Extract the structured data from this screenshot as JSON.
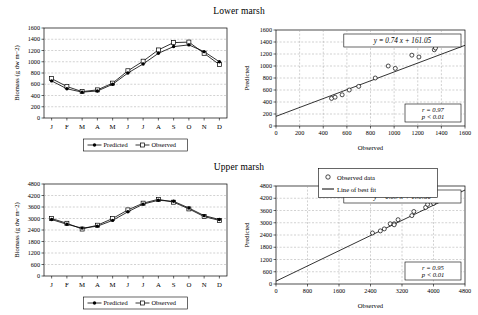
{
  "figure": {
    "lower_title": "Lower marsh",
    "upper_title": "Upper marsh"
  },
  "legend_main": {
    "predicted": "Predicted",
    "observed": "Observed"
  },
  "legend_scatter": {
    "observed_data": "Observed data",
    "line_of_best_fit": "Line of best fit"
  },
  "chart_data": [
    {
      "id": "lower-timeseries",
      "type": "line",
      "title": "Lower marsh",
      "xlabel": "",
      "ylabel": "Biomass (g dw m−2)",
      "categories": [
        "J",
        "F",
        "M",
        "A",
        "M",
        "J",
        "J",
        "A",
        "S",
        "O",
        "N",
        "D"
      ],
      "ylim": [
        0,
        1600
      ],
      "yticks": [
        0,
        200,
        400,
        600,
        800,
        1000,
        1200,
        1400,
        1600
      ],
      "grid": true,
      "legend_position": "bottom-center",
      "series": [
        {
          "name": "Predicted",
          "values": [
            660,
            520,
            460,
            480,
            600,
            800,
            960,
            1150,
            1270,
            1300,
            1180,
            1000
          ]
        },
        {
          "name": "Observed",
          "values": [
            700,
            560,
            470,
            500,
            620,
            840,
            1010,
            1210,
            1340,
            1350,
            1150,
            950
          ]
        }
      ]
    },
    {
      "id": "lower-scatter",
      "type": "scatter",
      "title": "",
      "xlabel": "Observed",
      "ylabel": "Predicted",
      "xlim": [
        0,
        1600
      ],
      "ylim": [
        0,
        1600
      ],
      "xticks": [
        0,
        200,
        400,
        600,
        800,
        1000,
        1200,
        1400,
        1600
      ],
      "yticks": [
        0,
        200,
        400,
        600,
        800,
        1000,
        1200,
        1400,
        1600
      ],
      "grid": true,
      "equation": "y = 0.74 x + 161.05",
      "stats": {
        "r": "r = 0.97",
        "p": "p < 0.01"
      },
      "fit": {
        "slope": 0.74,
        "intercept": 161.05
      },
      "points": [
        [
          470,
          460
        ],
        [
          500,
          480
        ],
        [
          560,
          520
        ],
        [
          620,
          600
        ],
        [
          700,
          660
        ],
        [
          840,
          800
        ],
        [
          950,
          1000
        ],
        [
          1010,
          960
        ],
        [
          1150,
          1180
        ],
        [
          1210,
          1150
        ],
        [
          1340,
          1270
        ],
        [
          1350,
          1300
        ]
      ],
      "legend_position": "none"
    },
    {
      "id": "upper-timeseries",
      "type": "line",
      "title": "Upper marsh",
      "xlabel": "",
      "ylabel": "Biomass (g dw m−2)",
      "categories": [
        "J",
        "F",
        "M",
        "A",
        "M",
        "J",
        "J",
        "A",
        "S",
        "O",
        "N",
        "D"
      ],
      "ylim": [
        0,
        4800
      ],
      "yticks": [
        0,
        600,
        1200,
        1800,
        2400,
        3000,
        3600,
        4200,
        4800
      ],
      "grid": true,
      "legend_position": "bottom-center",
      "series": [
        {
          "name": "Predicted",
          "values": [
            2950,
            2700,
            2500,
            2600,
            2900,
            3350,
            3750,
            3950,
            3900,
            3550,
            3150,
            2950
          ]
        },
        {
          "name": "Observed",
          "values": [
            3000,
            2750,
            2450,
            2650,
            3000,
            3450,
            3800,
            4000,
            3850,
            3500,
            3100,
            2900
          ]
        }
      ]
    },
    {
      "id": "upper-scatter",
      "type": "scatter",
      "title": "",
      "xlabel": "Observed",
      "ylabel": "Predicted",
      "xlim": [
        0,
        4800
      ],
      "ylim": [
        0,
        4800
      ],
      "xticks": [
        0,
        800,
        1600,
        2400,
        3200,
        4000,
        4800
      ],
      "yticks": [
        0,
        600,
        1200,
        1800,
        2400,
        3000,
        3600,
        4200,
        4800
      ],
      "grid": true,
      "equation": "y = 0.93 x + 139.50",
      "stats": {
        "r": "r = 0.95",
        "p": "p < 0.01"
      },
      "fit": {
        "slope": 0.93,
        "intercept": 139.5
      },
      "points": [
        [
          2450,
          2500
        ],
        [
          2650,
          2600
        ],
        [
          2750,
          2700
        ],
        [
          2900,
          2950
        ],
        [
          3000,
          2950
        ],
        [
          3000,
          2900
        ],
        [
          3100,
          3150
        ],
        [
          3450,
          3350
        ],
        [
          3500,
          3550
        ],
        [
          3800,
          3750
        ],
        [
          3850,
          3900
        ],
        [
          4000,
          3950
        ]
      ],
      "legend_position": "none"
    }
  ]
}
